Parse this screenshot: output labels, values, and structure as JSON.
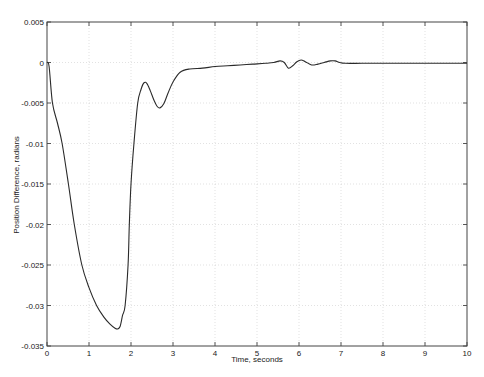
{
  "chart_data": {
    "type": "line",
    "title": "",
    "xlabel": "Time, seconds",
    "ylabel": "Position Difference, radians",
    "xlim": [
      0,
      10
    ],
    "ylim": [
      -0.035,
      0.005
    ],
    "xticks": [
      0,
      1,
      2,
      3,
      4,
      5,
      6,
      7,
      8,
      9,
      10
    ],
    "xtick_labels": [
      "0",
      "1",
      "2",
      "3",
      "4",
      "5",
      "6",
      "7",
      "8",
      "9",
      "10"
    ],
    "yticks": [
      0.005,
      0,
      -0.005,
      -0.01,
      -0.015,
      -0.02,
      -0.025,
      -0.03,
      -0.035
    ],
    "ytick_labels": [
      "0.005",
      "0",
      "-0.005",
      "-0.01",
      "-0.015",
      "-0.02",
      "-0.025",
      "-0.03",
      "-0.035"
    ],
    "grid": "dotted",
    "legend": "none",
    "series": [
      {
        "name": "Position Difference",
        "color": "#2a2a2a",
        "x": [
          0,
          0.05,
          0.13,
          0.25,
          0.36,
          0.51,
          0.65,
          0.83,
          1.0,
          1.18,
          1.35,
          1.5,
          1.62,
          1.68,
          1.74,
          1.8,
          1.86,
          1.93,
          1.96,
          2.0,
          2.07,
          2.16,
          2.24,
          2.31,
          2.38,
          2.46,
          2.55,
          2.62,
          2.69,
          2.78,
          2.88,
          3.0,
          3.17,
          3.4,
          3.7,
          4.0,
          4.3,
          4.6,
          4.9,
          5.2,
          5.4,
          5.55,
          5.65,
          5.75,
          5.85,
          5.95,
          6.05,
          6.15,
          6.3,
          6.45,
          6.6,
          6.75,
          6.86,
          6.97,
          7.1,
          7.5,
          8.0,
          9.0,
          10.0
        ],
        "y": [
          0,
          -0.0005,
          -0.005,
          -0.0075,
          -0.01,
          -0.015,
          -0.02,
          -0.025,
          -0.0278,
          -0.03,
          -0.0314,
          -0.0323,
          -0.0328,
          -0.0329,
          -0.0326,
          -0.0312,
          -0.03,
          -0.025,
          -0.02,
          -0.015,
          -0.01,
          -0.005,
          -0.0033,
          -0.0025,
          -0.0026,
          -0.0035,
          -0.0047,
          -0.0054,
          -0.0056,
          -0.0051,
          -0.0038,
          -0.0024,
          -0.0012,
          -0.0008,
          -0.0007,
          -0.0005,
          -0.0004,
          -0.0003,
          -0.0002,
          -0.0001,
          0.0,
          0.0002,
          0.0,
          -0.0007,
          -0.0004,
          0.0001,
          0.0003,
          0.0001,
          -0.0003,
          -0.0002,
          0.0,
          0.0002,
          0.0002,
          0.0,
          -0.0001,
          -0.0001,
          -0.0001,
          -0.0001,
          -0.0001
        ]
      }
    ]
  }
}
